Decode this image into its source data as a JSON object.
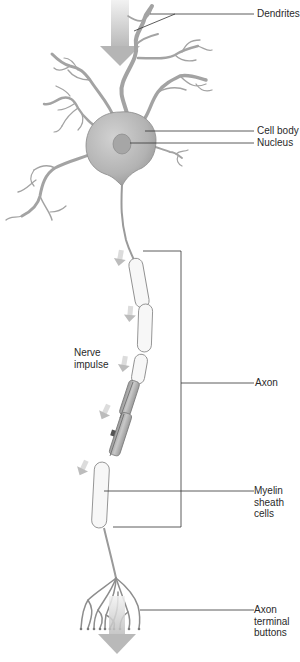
{
  "diagram": {
    "type": "neuron-anatomy",
    "colors": {
      "cell": "#b9b9b9",
      "cell_dark": "#8f8f8f",
      "outline": "#7a7a7a",
      "myelin_fill": "#f6f6f6",
      "myelin_stroke": "#8a8a8a",
      "arrow": "#c4c4c4",
      "leader_line": "#333333",
      "text": "#2a2a2a"
    },
    "labels": {
      "dendrites": "Dendrites",
      "cell_body": "Cell body",
      "nucleus": "Nucleus",
      "nerve_impulse": "Nerve\nimpulse",
      "axon": "Axon",
      "myelin": "Myelin\nsheath\ncells",
      "terminal": "Axon\nterminal\nbuttons"
    }
  }
}
